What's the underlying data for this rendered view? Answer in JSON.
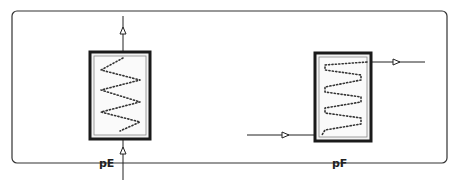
{
  "diagram": {
    "type": "heat-exchanger-symbols",
    "frame": {
      "x": 12,
      "y": 11,
      "width": 435,
      "height": 152,
      "radius": 5
    },
    "components": [
      {
        "id": "pE",
        "label": "pE",
        "description": "Vertical-flow coil exchanger; flow enters from bottom, exits at top",
        "box": {
          "x": 89,
          "y": 51,
          "width": 62,
          "height": 89
        },
        "flow_in": {
          "direction": "up",
          "side": "bottom"
        },
        "flow_out": {
          "direction": "up",
          "side": "top"
        },
        "coil_turns": 3
      },
      {
        "id": "pF",
        "label": "pF",
        "description": "Horizontal-flow coil exchanger; flow enters bottom-left, exits top-right",
        "box": {
          "x": 314,
          "y": 52,
          "width": 58,
          "height": 90
        },
        "flow_in": {
          "direction": "right",
          "side": "left-bottom"
        },
        "flow_out": {
          "direction": "right",
          "side": "right-top"
        },
        "coil_turns": 4
      }
    ],
    "colors": {
      "line": "#222222",
      "border": "#1a1a1a",
      "inner": "#f4f4f4",
      "dots": "#333333"
    }
  }
}
